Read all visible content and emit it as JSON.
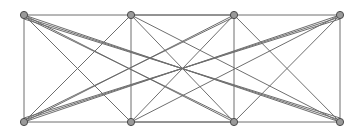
{
  "figure": {
    "name": "bipartite-graph-drawing",
    "kind": "graph-diagram",
    "width": 363,
    "height": 139,
    "background_color": "#ffffff"
  },
  "style": {
    "edge_color": "#6e6e6e",
    "edge_width": 1,
    "vertex_fill": "#9a9a9a",
    "vertex_stroke": "#4a4a4a",
    "vertex_stroke_width": 1,
    "vertex_radius": 3.6
  },
  "graph": {
    "vertex_count": 8,
    "edge_count": 26,
    "top_row_y": 15,
    "bottom_row_y": 122,
    "column_x": [
      24,
      131,
      234,
      340
    ],
    "vertices": [
      {
        "id": "t1",
        "label": "t1",
        "row": "top",
        "column": 0,
        "x": 24,
        "y": 15
      },
      {
        "id": "t2",
        "label": "t2",
        "row": "top",
        "column": 1,
        "x": 131,
        "y": 15
      },
      {
        "id": "t3",
        "label": "t3",
        "row": "top",
        "column": 2,
        "x": 234,
        "y": 15
      },
      {
        "id": "t4",
        "label": "t4",
        "row": "top",
        "column": 3,
        "x": 340,
        "y": 15
      },
      {
        "id": "b1",
        "label": "b1",
        "row": "bottom",
        "column": 0,
        "x": 24,
        "y": 122
      },
      {
        "id": "b2",
        "label": "b2",
        "row": "bottom",
        "column": 1,
        "x": 131,
        "y": 122
      },
      {
        "id": "b3",
        "label": "b3",
        "row": "bottom",
        "column": 2,
        "x": 234,
        "y": 122
      },
      {
        "id": "b4",
        "label": "b4",
        "row": "bottom",
        "column": 3,
        "x": 340,
        "y": 122
      }
    ],
    "edges": [
      {
        "source": "t1",
        "target": "b1",
        "x1": 24,
        "y1": 15,
        "x2": 24,
        "y2": 122
      },
      {
        "source": "t2",
        "target": "b2",
        "x1": 131,
        "y1": 15,
        "x2": 131,
        "y2": 122
      },
      {
        "source": "t3",
        "target": "b3",
        "x1": 234,
        "y1": 15,
        "x2": 234,
        "y2": 122
      },
      {
        "source": "t4",
        "target": "b4",
        "x1": 340,
        "y1": 15,
        "x2": 340,
        "y2": 122
      },
      {
        "source": "t1",
        "target": "b2",
        "x1": 24,
        "y1": 15,
        "x2": 131,
        "y2": 122
      },
      {
        "source": "t1",
        "target": "b3",
        "x1": 24,
        "y1": 15,
        "x2": 234,
        "y2": 122
      },
      {
        "source": "t1",
        "target": "b4",
        "x1": 24,
        "y1": 15,
        "x2": 340,
        "y2": 122
      },
      {
        "source": "t2",
        "target": "b1",
        "x1": 131,
        "y1": 15,
        "x2": 24,
        "y2": 122
      },
      {
        "source": "t2",
        "target": "b3",
        "x1": 131,
        "y1": 15,
        "x2": 234,
        "y2": 122
      },
      {
        "source": "t2",
        "target": "b4",
        "x1": 131,
        "y1": 15,
        "x2": 340,
        "y2": 122
      },
      {
        "source": "t3",
        "target": "b1",
        "x1": 234,
        "y1": 15,
        "x2": 24,
        "y2": 122
      },
      {
        "source": "t3",
        "target": "b2",
        "x1": 234,
        "y1": 15,
        "x2": 131,
        "y2": 122
      },
      {
        "source": "t3",
        "target": "b4",
        "x1": 234,
        "y1": 15,
        "x2": 340,
        "y2": 122
      },
      {
        "source": "t4",
        "target": "b1",
        "x1": 340,
        "y1": 15,
        "x2": 24,
        "y2": 122
      },
      {
        "source": "t4",
        "target": "b2",
        "x1": 340,
        "y1": 15,
        "x2": 131,
        "y2": 122
      },
      {
        "source": "t4",
        "target": "b3",
        "x1": 340,
        "y1": 15,
        "x2": 234,
        "y2": 122
      },
      {
        "source": "t1",
        "target": "t3",
        "x1": 24,
        "y1": 15,
        "x2": 234,
        "y2": 15
      },
      {
        "source": "t2",
        "target": "t4",
        "x1": 131,
        "y1": 15,
        "x2": 340,
        "y2": 15
      },
      {
        "source": "b1",
        "target": "b3",
        "x1": 24,
        "y1": 122,
        "x2": 234,
        "y2": 122
      },
      {
        "source": "b2",
        "target": "b4",
        "x1": 131,
        "y1": 122,
        "x2": 340,
        "y2": 122
      },
      {
        "source": "t1",
        "target": "b3",
        "x1": 24,
        "y1": 17,
        "x2": 234,
        "y2": 120
      },
      {
        "source": "t1",
        "target": "b4",
        "x1": 24,
        "y1": 19,
        "x2": 340,
        "y2": 118
      },
      {
        "source": "b1",
        "target": "t3",
        "x1": 24,
        "y1": 120,
        "x2": 234,
        "y2": 17
      },
      {
        "source": "b1",
        "target": "t4",
        "x1": 24,
        "y1": 118,
        "x2": 340,
        "y2": 19
      },
      {
        "source": "t4",
        "target": "b1",
        "x1": 340,
        "y1": 17,
        "x2": 24,
        "y2": 120
      },
      {
        "source": "b4",
        "target": "t1",
        "x1": 340,
        "y1": 120,
        "x2": 24,
        "y2": 17
      }
    ]
  }
}
